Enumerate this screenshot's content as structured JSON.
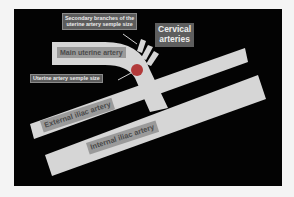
{
  "diagram": {
    "colors": {
      "background": "#030303",
      "vessel": "#d6d6d6",
      "vessel_label_bg": "#9a9a9a",
      "callout_bg": "#5c5c5c",
      "sample_point": "#b23a3a"
    },
    "labels": {
      "secondary_branches_line1": "Secondary branches of the",
      "secondary_branches_line2": "uterine artery semple size",
      "cervical_line1": "Cervical",
      "cervical_line2": "arteries",
      "main_uterine": "Main uterine artery",
      "uterine_sample": "Uterine artery semple size",
      "external_iliac": "External iliac artery",
      "internal_iliac": "Internal iliac artery"
    }
  }
}
